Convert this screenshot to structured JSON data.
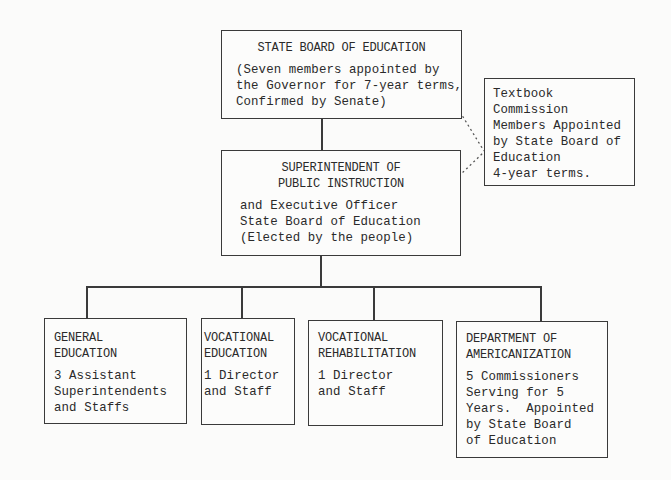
{
  "chart": {
    "state_board": {
      "title": "STATE BOARD OF EDUCATION",
      "lines": [
        "(Seven members appointed by",
        "the Governor for 7-year terms,",
        "Confirmed by Senate)"
      ]
    },
    "textbook_commission": {
      "lines": [
        "Textbook",
        "Commission",
        "Members Appointed",
        "by State Board of",
        "Education",
        "4-year terms."
      ]
    },
    "superintendent": {
      "title_lines": [
        "SUPERINTENDENT OF",
        "PUBLIC INSTRUCTION"
      ],
      "lines": [
        "and Executive Officer",
        "State Board of Education",
        "(Elected by the people)"
      ]
    },
    "divisions": [
      {
        "title_lines": [
          "GENERAL",
          "EDUCATION"
        ],
        "lines": [
          "3 Assistant",
          "Superintendents",
          "and Staffs"
        ]
      },
      {
        "title_lines": [
          "VOCATIONAL",
          "EDUCATION"
        ],
        "lines": [
          "1 Director",
          "and Staff"
        ]
      },
      {
        "title_lines": [
          "VOCATIONAL",
          "REHABILITATION"
        ],
        "lines": [
          "1 Director",
          "and Staff"
        ]
      },
      {
        "title_lines": [
          "DEPARTMENT OF",
          "AMERICANIZATION"
        ],
        "lines": [
          "5 Commissioners",
          "Serving for 5",
          "Years.  Appointed",
          "by State Board",
          "of Education"
        ]
      }
    ]
  }
}
